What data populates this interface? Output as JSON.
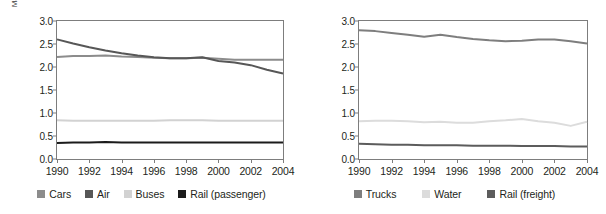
{
  "charts": [
    {
      "key": "passenger",
      "ylabel": "MJ/passenger km",
      "xlabel": "",
      "legend": [
        {
          "label": "Cars",
          "color": "#8c8c8c"
        },
        {
          "label": "Air",
          "color": "#575757"
        },
        {
          "label": "Buses",
          "color": "#d2d2d2"
        },
        {
          "label": "Rail (passenger)",
          "color": "#1b1b1b"
        }
      ]
    },
    {
      "key": "freight",
      "ylabel": "MJ/tonne km",
      "xlabel": "",
      "legend": [
        {
          "label": "Trucks",
          "color": "#7e7e7e"
        },
        {
          "label": "Water",
          "color": "#dcdcdc"
        },
        {
          "label": "Rail (freight)",
          "color": "#5c5c5c"
        }
      ]
    }
  ],
  "chart_data": [
    {
      "type": "line",
      "title": "",
      "xlabel": "",
      "ylabel": "MJ/passenger km",
      "ylim": [
        0.0,
        3.0
      ],
      "xlim": [
        1990,
        2004
      ],
      "yticks": [
        "0.0",
        "0.5",
        "1.0",
        "1.5",
        "2.0",
        "2.5",
        "3.0"
      ],
      "ytick_values": [
        0.0,
        0.5,
        1.0,
        1.5,
        2.0,
        2.5,
        3.0
      ],
      "xticks": [
        "1990",
        "1992",
        "1994",
        "1996",
        "1998",
        "2000",
        "2002",
        "2004"
      ],
      "xtick_values": [
        1990,
        1992,
        1994,
        1996,
        1998,
        2000,
        2002,
        2004
      ],
      "x": [
        1990,
        1991,
        1992,
        1993,
        1994,
        1995,
        1996,
        1997,
        1998,
        1999,
        2000,
        2001,
        2002,
        2003,
        2004
      ],
      "grid": false,
      "legend_position": "bottom",
      "series": [
        {
          "name": "Cars",
          "color": "#8c8c8c",
          "values": [
            2.22,
            2.24,
            2.24,
            2.25,
            2.23,
            2.22,
            2.2,
            2.19,
            2.19,
            2.2,
            2.18,
            2.16,
            2.16,
            2.16,
            2.16
          ]
        },
        {
          "name": "Air",
          "color": "#575757",
          "values": [
            2.6,
            2.51,
            2.43,
            2.36,
            2.3,
            2.25,
            2.21,
            2.19,
            2.19,
            2.21,
            2.13,
            2.1,
            2.04,
            1.94,
            1.86
          ]
        },
        {
          "name": "Buses",
          "color": "#d2d2d2",
          "values": [
            0.84,
            0.83,
            0.83,
            0.83,
            0.83,
            0.83,
            0.83,
            0.84,
            0.84,
            0.84,
            0.83,
            0.83,
            0.83,
            0.83,
            0.83
          ]
        },
        {
          "name": "Rail (passenger)",
          "color": "#1b1b1b",
          "values": [
            0.35,
            0.36,
            0.36,
            0.37,
            0.36,
            0.36,
            0.36,
            0.36,
            0.36,
            0.36,
            0.36,
            0.36,
            0.36,
            0.36,
            0.36
          ]
        }
      ]
    },
    {
      "type": "line",
      "title": "",
      "xlabel": "",
      "ylabel": "MJ/tonne km",
      "ylim": [
        0.0,
        3.0
      ],
      "xlim": [
        1990,
        2004
      ],
      "yticks": [
        "0.0",
        "0.5",
        "1.0",
        "1.5",
        "2.0",
        "2.5",
        "3.0"
      ],
      "ytick_values": [
        0.0,
        0.5,
        1.0,
        1.5,
        2.0,
        2.5,
        3.0
      ],
      "xticks": [
        "1990",
        "1992",
        "1994",
        "1996",
        "1998",
        "2000",
        "2002",
        "2004"
      ],
      "xtick_values": [
        1990,
        1992,
        1994,
        1996,
        1998,
        2000,
        2002,
        2004
      ],
      "x": [
        1990,
        1991,
        1992,
        1993,
        1994,
        1995,
        1996,
        1997,
        1998,
        1999,
        2000,
        2001,
        2002,
        2003,
        2004
      ],
      "grid": false,
      "legend_position": "bottom",
      "series": [
        {
          "name": "Trucks",
          "color": "#7e7e7e",
          "values": [
            2.8,
            2.78,
            2.74,
            2.7,
            2.66,
            2.7,
            2.65,
            2.61,
            2.58,
            2.56,
            2.57,
            2.6,
            2.6,
            2.56,
            2.51
          ]
        },
        {
          "name": "Water",
          "color": "#dcdcdc",
          "values": [
            0.82,
            0.83,
            0.83,
            0.82,
            0.8,
            0.81,
            0.79,
            0.79,
            0.82,
            0.84,
            0.87,
            0.82,
            0.79,
            0.72,
            0.81
          ]
        },
        {
          "name": "Rail (freight)",
          "color": "#5c5c5c",
          "values": [
            0.33,
            0.32,
            0.31,
            0.31,
            0.3,
            0.3,
            0.3,
            0.29,
            0.29,
            0.29,
            0.28,
            0.28,
            0.28,
            0.27,
            0.27
          ]
        }
      ]
    }
  ]
}
